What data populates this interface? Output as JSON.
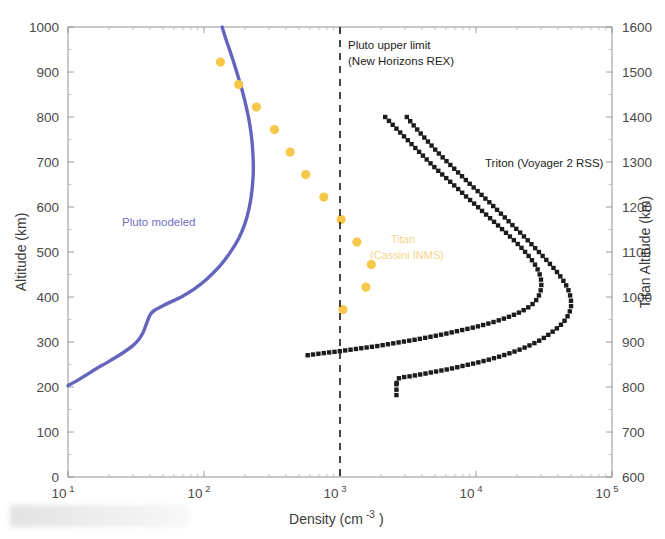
{
  "figure": {
    "background": "#ffffff",
    "width": 665,
    "height": 539
  },
  "axes": {
    "x": {
      "label": "Density (cm",
      "label_sup": "-3",
      "label_close": ")",
      "scale": "log",
      "range": [
        10,
        100000
      ],
      "tick_mantissa": "10",
      "ticks": [
        {
          "value": 10,
          "exp": "1"
        },
        {
          "value": 100,
          "exp": "2"
        },
        {
          "value": 1000,
          "exp": "3"
        },
        {
          "value": 10000,
          "exp": "4"
        },
        {
          "value": 100000,
          "exp": "5"
        }
      ]
    },
    "y_left": {
      "label": "Altitude (km)",
      "scale": "linear",
      "range": [
        0,
        1000
      ],
      "ticks": [
        0,
        100,
        200,
        300,
        400,
        500,
        600,
        700,
        800,
        900,
        1000
      ]
    },
    "y_right": {
      "label": "Titan Altitude (km)",
      "scale": "linear",
      "range": [
        600,
        1600
      ],
      "ticks": [
        600,
        700,
        800,
        900,
        1000,
        1100,
        1200,
        1300,
        1400,
        1500,
        1600
      ]
    }
  },
  "annotations": {
    "pluto_limit_line1": "Pluto upper limit",
    "pluto_limit_line2": "(New Horizons  REX)",
    "pluto_limit_value": 1000,
    "pluto_modeled": "Pluto modeled",
    "triton": "Triton (Voyager 2 RSS)",
    "titan_line1": "Titan",
    "titan_line2": "(Cassini INMS)"
  },
  "colors": {
    "pluto_curve": "#6464be",
    "pluto_label": "#6f6fc4",
    "titan_points": "#f5c84a",
    "titan_label": "#f3d48a",
    "triton_points": "#1b1b1b",
    "limit_line": "#1a1a1a",
    "frame": "#9a9a9a",
    "text": "#3b3b3b"
  },
  "chart_data": {
    "type": "line",
    "title": "",
    "xlabel": "Density (cm^-3)",
    "ylabel": "Altitude (km)",
    "ylabel_right": "Titan Altitude (km)",
    "xscale": "log",
    "xlim": [
      10,
      100000
    ],
    "ylim": [
      0,
      1000
    ],
    "ylim_right": [
      600,
      1600
    ],
    "grid": false,
    "legend": "inline annotations",
    "series": [
      {
        "name": "Pluto modeled",
        "type": "line",
        "color": "#6464be",
        "axis": "left",
        "points": [
          [
            10.0,
            203
          ],
          [
            11.5,
            213
          ],
          [
            13.5,
            226
          ],
          [
            16.0,
            240
          ],
          [
            19.0,
            253
          ],
          [
            22.5,
            266
          ],
          [
            26.5,
            280
          ],
          [
            30.0,
            292
          ],
          [
            33.0,
            305
          ],
          [
            35.5,
            320
          ],
          [
            37.5,
            338
          ],
          [
            39.0,
            352
          ],
          [
            40.5,
            362
          ],
          [
            43.0,
            370
          ],
          [
            48.0,
            378
          ],
          [
            56.0,
            388
          ],
          [
            68.0,
            400
          ],
          [
            85.0,
            418
          ],
          [
            105.0,
            440
          ],
          [
            130.0,
            468
          ],
          [
            155.0,
            498
          ],
          [
            180.0,
            530
          ],
          [
            200.0,
            563
          ],
          [
            215.0,
            598
          ],
          [
            225.0,
            635
          ],
          [
            230.0,
            672
          ],
          [
            230.0,
            705
          ],
          [
            226.0,
            742
          ],
          [
            218.0,
            780
          ],
          [
            206.0,
            818
          ],
          [
            192.0,
            856
          ],
          [
            176.0,
            895
          ],
          [
            160.0,
            935
          ],
          [
            146.0,
            970
          ],
          [
            136.0,
            1000
          ]
        ]
      },
      {
        "name": "Titan (Cassini INMS)",
        "type": "scatter",
        "color": "#f5c84a",
        "axis": "left",
        "points": [
          [
            132,
            922
          ],
          [
            180,
            872
          ],
          [
            243,
            822
          ],
          [
            330,
            772
          ],
          [
            430,
            722
          ],
          [
            560,
            672
          ],
          [
            760,
            622
          ],
          [
            1020,
            572
          ],
          [
            1330,
            522
          ],
          [
            1700,
            472
          ],
          [
            1550,
            422
          ],
          [
            1050,
            372
          ]
        ]
      },
      {
        "name": "Triton (Voyager 2 RSS) outer",
        "type": "scatter-line",
        "color": "#1b1b1b",
        "axis": "right",
        "points": [
          [
            3100,
            1400
          ],
          [
            3400,
            1385
          ],
          [
            3750,
            1370
          ],
          [
            4150,
            1355
          ],
          [
            4600,
            1340
          ],
          [
            5100,
            1325
          ],
          [
            5700,
            1310
          ],
          [
            6400,
            1295
          ],
          [
            7200,
            1280
          ],
          [
            8100,
            1265
          ],
          [
            9100,
            1250
          ],
          [
            10300,
            1235
          ],
          [
            11600,
            1220
          ],
          [
            13100,
            1205
          ],
          [
            14700,
            1190
          ],
          [
            16500,
            1175
          ],
          [
            18500,
            1160
          ],
          [
            20800,
            1145
          ],
          [
            23300,
            1130
          ],
          [
            26000,
            1115
          ],
          [
            29000,
            1100
          ],
          [
            32300,
            1085
          ],
          [
            35800,
            1070
          ],
          [
            39500,
            1055
          ],
          [
            43000,
            1040
          ],
          [
            46200,
            1025
          ],
          [
            48500,
            1010
          ],
          [
            49800,
            995
          ],
          [
            50000,
            980
          ],
          [
            48500,
            965
          ],
          [
            45500,
            950
          ],
          [
            41000,
            935
          ],
          [
            35500,
            920
          ],
          [
            30000,
            905
          ],
          [
            25000,
            893
          ],
          [
            20500,
            882
          ],
          [
            16500,
            872
          ],
          [
            13200,
            863
          ],
          [
            10500,
            855
          ],
          [
            8300,
            848
          ],
          [
            6600,
            841
          ],
          [
            5200,
            835
          ],
          [
            4100,
            829
          ],
          [
            3300,
            824
          ],
          [
            2700,
            819
          ],
          [
            2600,
            805
          ]
        ]
      },
      {
        "name": "Triton (Voyager 2 RSS) inner",
        "type": "scatter-line",
        "color": "#1b1b1b",
        "axis": "right",
        "points": [
          [
            2150,
            1400
          ],
          [
            2400,
            1385
          ],
          [
            2680,
            1370
          ],
          [
            3000,
            1355
          ],
          [
            3350,
            1340
          ],
          [
            3750,
            1325
          ],
          [
            4200,
            1310
          ],
          [
            4700,
            1295
          ],
          [
            5300,
            1280
          ],
          [
            6000,
            1265
          ],
          [
            6800,
            1250
          ],
          [
            7700,
            1235
          ],
          [
            8700,
            1220
          ],
          [
            9900,
            1205
          ],
          [
            11200,
            1190
          ],
          [
            12700,
            1175
          ],
          [
            14400,
            1160
          ],
          [
            16300,
            1145
          ],
          [
            18400,
            1130
          ],
          [
            20700,
            1115
          ],
          [
            23000,
            1100
          ],
          [
            25300,
            1085
          ],
          [
            27400,
            1070
          ],
          [
            29000,
            1055
          ],
          [
            30000,
            1040
          ],
          [
            30200,
            1025
          ],
          [
            29600,
            1010
          ],
          [
            28000,
            995
          ],
          [
            25500,
            982
          ],
          [
            22200,
            970
          ],
          [
            18500,
            959
          ],
          [
            15000,
            949
          ],
          [
            12000,
            940
          ],
          [
            9500,
            932
          ],
          [
            7500,
            925
          ],
          [
            5900,
            918
          ],
          [
            4700,
            912
          ],
          [
            3700,
            906
          ],
          [
            2950,
            901
          ],
          [
            2350,
            896
          ],
          [
            1880,
            891
          ],
          [
            1500,
            887
          ],
          [
            1200,
            883
          ],
          [
            960,
            879
          ],
          [
            790,
            876
          ],
          [
            660,
            873
          ],
          [
            560,
            870
          ]
        ]
      }
    ]
  }
}
